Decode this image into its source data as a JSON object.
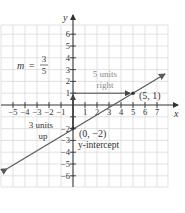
{
  "figure": {
    "type": "coordinate-graph",
    "axes": {
      "x_label": "x",
      "y_label": "y",
      "x_ticks": [
        "−5",
        "−4",
        "−3",
        "−2",
        "−1",
        "1",
        "2",
        "3",
        "4",
        "5",
        "6",
        "7"
      ],
      "y_ticks_positive": [
        "1",
        "2",
        "3",
        "4",
        "5",
        "6"
      ],
      "y_ticks_negative": [
        "−2",
        "−3",
        "−4",
        "−5",
        "−6"
      ],
      "x_range": [
        -5.7,
        7.9
      ],
      "y_range": [
        -6.9,
        6.8
      ]
    },
    "line": {
      "equation": "y = (3/5)x − 2",
      "slope_num": 3,
      "slope_den": 5,
      "intercept": -2
    },
    "annotations": {
      "slope_prefix": "m =",
      "slope_numerator": "3",
      "slope_denominator": "5",
      "run_label_1": "5 units",
      "run_label_2": "right",
      "rise_label_1": "3 units",
      "rise_label_2": "up",
      "point_label": "(5, 1)",
      "intercept_point_label": "(0, −2)",
      "intercept_label": "y-intercept"
    },
    "colors": {
      "grid": "#d4d4d4",
      "axis": "#333333",
      "line": "#5a5a5a",
      "annotation_gray": "#8a8a8a",
      "text": "#333333"
    }
  }
}
